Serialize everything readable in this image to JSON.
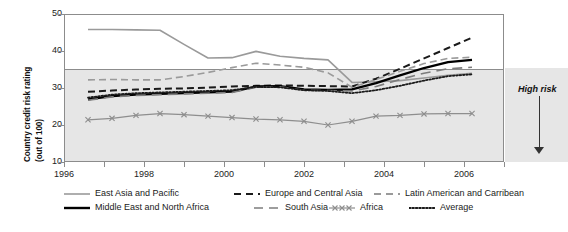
{
  "chart_data": {
    "type": "line",
    "title": "",
    "xlabel": "",
    "ylabel": "Country credit risk rating (out of 100)",
    "ylabel_line1": "Country credit risk rating",
    "ylabel_line2": "(out of 100)",
    "ylim": [
      10,
      50
    ],
    "xlim": [
      1996,
      2007
    ],
    "yticks": [
      50,
      40,
      30,
      20,
      10
    ],
    "xticks": [
      1996,
      1997,
      1998,
      1999,
      2000,
      2001,
      2002,
      2003,
      2004,
      2005,
      2006,
      2007
    ],
    "xtick_labels": [
      "1996",
      "",
      "1998",
      "",
      "2000",
      "",
      "2002",
      "",
      "2004",
      "",
      "2006",
      ""
    ],
    "grid": false,
    "gridline_at": 30,
    "shaded_region": {
      "from": 10,
      "to": 30,
      "label": "High risk",
      "color": "#e6e6e6"
    },
    "annotations": [
      {
        "text": "High risk",
        "x": 2007.4,
        "y": 29,
        "style": "bold-italic",
        "arrow": "down"
      }
    ],
    "legend_position": "bottom",
    "x": [
      1996.6,
      1997.2,
      1997.8,
      1998.4,
      1999.0,
      1999.6,
      2000.2,
      2000.8,
      2001.4,
      2002.0,
      2002.6,
      2003.2,
      2003.8,
      2004.4,
      2005.0,
      2005.6,
      2006.2
    ],
    "series": [
      {
        "name": "East Asia and Pacific",
        "style": "solid",
        "color": "#9a9a9a",
        "width": 1.6,
        "marker": "none",
        "values": [
          45.8,
          45.8,
          45.7,
          45.6,
          41.8,
          38.1,
          38.2,
          39.9,
          38.6,
          38.0,
          37.6,
          31.5,
          31.7,
          32.0,
          32.7,
          33.4,
          34.0
        ]
      },
      {
        "name": "Europe and Central Asia",
        "style": "dashed",
        "color": "#1a1a1a",
        "width": 2.0,
        "marker": "none",
        "values": [
          29.0,
          29.3,
          29.6,
          29.8,
          29.9,
          30.1,
          30.4,
          30.6,
          30.7,
          30.6,
          30.5,
          30.4,
          32.5,
          35.2,
          38.0,
          40.8,
          43.6
        ]
      },
      {
        "name": "Latin American and Carribean",
        "style": "dashed",
        "color": "#9a9a9a",
        "width": 1.6,
        "marker": "none",
        "values": [
          32.2,
          32.3,
          32.2,
          32.2,
          33.1,
          34.2,
          35.5,
          36.7,
          36.2,
          35.6,
          34.1,
          30.2,
          32.3,
          34.5,
          36.6,
          38.0,
          38.3
        ]
      },
      {
        "name": "Middle East and North Africa",
        "style": "solid",
        "color": "#000000",
        "width": 2.3,
        "marker": "none",
        "values": [
          26.9,
          27.8,
          28.2,
          28.4,
          28.6,
          28.8,
          29.0,
          30.4,
          30.5,
          29.6,
          29.5,
          29.6,
          31.3,
          33.4,
          35.4,
          37.0,
          37.6
        ]
      },
      {
        "name": "South Asia",
        "style": "dashed-long",
        "color": "#7d7d7d",
        "width": 1.6,
        "marker": "none",
        "values": [
          26.7,
          27.6,
          28.0,
          28.2,
          28.4,
          28.6,
          28.8,
          30.2,
          30.3,
          29.4,
          29.3,
          29.2,
          30.4,
          32.3,
          34.0,
          35.2,
          35.6
        ]
      },
      {
        "name": "Africa",
        "style": "solid",
        "color": "#8e8e8e",
        "width": 1.2,
        "marker": "x",
        "values": [
          21.4,
          21.8,
          22.6,
          23.1,
          22.8,
          22.4,
          22.0,
          21.6,
          21.4,
          21.0,
          20.0,
          21.0,
          22.4,
          22.6,
          23.0,
          23.1,
          23.1
        ]
      },
      {
        "name": "Average",
        "style": "dotted",
        "color": "#1a1a1a",
        "width": 1.8,
        "marker": "none",
        "values": [
          27.4,
          28.2,
          28.6,
          28.8,
          29.0,
          29.2,
          29.4,
          30.3,
          30.2,
          29.4,
          29.2,
          28.6,
          29.4,
          30.6,
          32.0,
          33.2,
          33.7
        ]
      }
    ],
    "legend": [
      {
        "label": "East Asia and Pacific",
        "style": "solid",
        "color": "#9a9a9a"
      },
      {
        "label": "Europe and Central Asia",
        "style": "dashed",
        "color": "#1a1a1a"
      },
      {
        "label": "Latin American and Carribean",
        "style": "dashed",
        "color": "#9a9a9a"
      },
      {
        "label": "Middle East and North Africa",
        "style": "solid",
        "color": "#000000"
      },
      {
        "label": "South Asia",
        "style": "dashed-long",
        "color": "#7d7d7d"
      },
      {
        "label": "Africa",
        "style": "marker-x",
        "color": "#8e8e8e"
      },
      {
        "label": "Average",
        "style": "dotted",
        "color": "#1a1a1a"
      }
    ]
  }
}
